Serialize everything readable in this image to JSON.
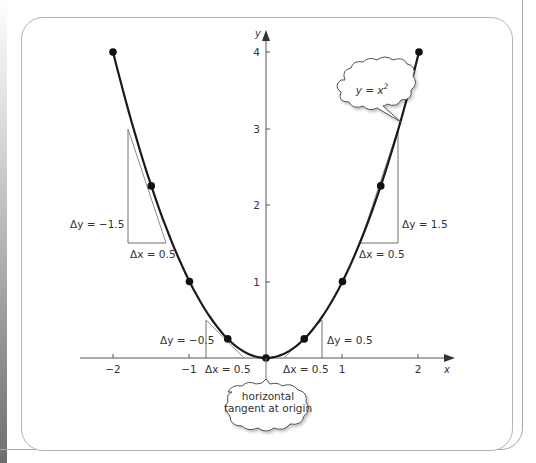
{
  "chart_data": {
    "type": "line",
    "title": "",
    "function": "y = x^2",
    "xlabel": "x",
    "ylabel": "y",
    "xlim": [
      -2.2,
      2.3
    ],
    "ylim": [
      -0.1,
      4.2
    ],
    "x_ticks": [
      "-2",
      "-1",
      "1",
      "2"
    ],
    "y_ticks": [
      "1",
      "2",
      "3",
      "4"
    ],
    "grid": false,
    "points": [
      {
        "x": -2,
        "y": 4
      },
      {
        "x": -1.5,
        "y": 2.25
      },
      {
        "x": -1,
        "y": 1
      },
      {
        "x": -0.5,
        "y": 0.25
      },
      {
        "x": 0,
        "y": 0
      },
      {
        "x": 0.5,
        "y": 0.25
      },
      {
        "x": 1,
        "y": 1
      },
      {
        "x": 1.5,
        "y": 2.25
      },
      {
        "x": 2,
        "y": 4
      }
    ],
    "tangent_triangles": [
      {
        "at_x": -1.5,
        "dx": "Δx = 0.5",
        "dy": "Δy = −1.5",
        "slope": -3
      },
      {
        "at_x": -0.5,
        "dx": "Δx = 0.5",
        "dy": "Δy = −0.5",
        "slope": -1
      },
      {
        "at_x": 0.5,
        "dx": "Δx = 0.5",
        "dy": "Δy = 0.5",
        "slope": 1
      },
      {
        "at_x": 1.5,
        "dx": "Δx = 0.5",
        "dy": "Δy = 1.5",
        "slope": 3
      }
    ],
    "annotations": [
      "y = x²",
      "horizontal tangent at origin"
    ]
  },
  "labels": {
    "axis_x": "x",
    "axis_y": "y",
    "tick_x_m2": "−2",
    "tick_x_m1": "−1",
    "tick_x_1": "1",
    "tick_x_2": "2",
    "tick_y_1": "1",
    "tick_y_2": "2",
    "tick_y_3": "3",
    "tick_y_4": "4",
    "dy_left_big": "Δy = −1.5",
    "dx_left_big": "Δx = 0.5",
    "dy_left_small": "Δy = −0.5",
    "dx_left_small": "Δx = 0.5",
    "dy_right_small": "Δy = 0.5",
    "dx_right_small": "Δx = 0.5",
    "dy_right_big": "Δy = 1.5",
    "dx_right_big": "Δx = 0.5",
    "bubble_function_y": "y = x",
    "bubble_function_exp": "2",
    "bubble_origin_line1": "horizontal",
    "bubble_origin_line2": "tangent at origin"
  },
  "colors": {
    "curve": "#1a1a1a",
    "axes": "#555555",
    "triangles": "#707070",
    "tangents": "#909090",
    "text": "#333333"
  }
}
